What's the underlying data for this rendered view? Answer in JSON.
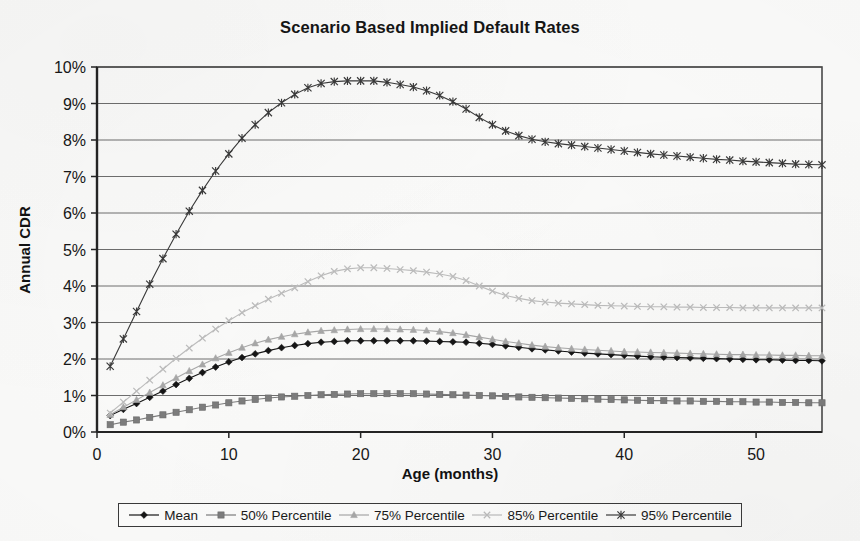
{
  "chart_data": {
    "type": "line",
    "title": "Scenario Based Implied Default Rates",
    "xlabel": "Age (months)",
    "ylabel": "Annual CDR",
    "grid": true,
    "legend_position": "bottom",
    "xlim": [
      0,
      55
    ],
    "ylim": [
      0,
      10
    ],
    "x_ticks": [
      "0",
      "10",
      "20",
      "30",
      "40",
      "50"
    ],
    "x_tick_values": [
      0,
      10,
      20,
      30,
      40,
      50
    ],
    "y_ticks": [
      "0%",
      "1%",
      "2%",
      "3%",
      "4%",
      "5%",
      "6%",
      "7%",
      "8%",
      "9%",
      "10%"
    ],
    "y_tick_values": [
      0,
      1,
      2,
      3,
      4,
      5,
      6,
      7,
      8,
      9,
      10
    ],
    "y_unit": "%",
    "x": [
      1,
      2,
      3,
      4,
      5,
      6,
      7,
      8,
      9,
      10,
      11,
      12,
      13,
      14,
      15,
      16,
      17,
      18,
      19,
      20,
      21,
      22,
      23,
      24,
      25,
      26,
      27,
      28,
      29,
      30,
      31,
      32,
      33,
      34,
      35,
      36,
      37,
      38,
      39,
      40,
      41,
      42,
      43,
      44,
      45,
      46,
      47,
      48,
      49,
      50,
      51,
      52,
      53,
      54,
      55
    ],
    "series": [
      {
        "name": "Mean",
        "color": "#151515",
        "marker": "diamond",
        "values": [
          0.45,
          0.62,
          0.78,
          0.95,
          1.12,
          1.3,
          1.47,
          1.63,
          1.78,
          1.92,
          2.04,
          2.14,
          2.23,
          2.31,
          2.37,
          2.42,
          2.46,
          2.48,
          2.5,
          2.5,
          2.5,
          2.5,
          2.5,
          2.5,
          2.49,
          2.48,
          2.47,
          2.46,
          2.43,
          2.4,
          2.36,
          2.32,
          2.28,
          2.25,
          2.22,
          2.19,
          2.16,
          2.14,
          2.12,
          2.1,
          2.08,
          2.06,
          2.05,
          2.04,
          2.03,
          2.02,
          2.01,
          2.0,
          1.99,
          1.98,
          1.98,
          1.97,
          1.96,
          1.96,
          1.95
        ]
      },
      {
        "name": "50% Percentile",
        "color": "#7d7d7d",
        "marker": "square",
        "values": [
          0.2,
          0.27,
          0.33,
          0.4,
          0.47,
          0.54,
          0.61,
          0.68,
          0.74,
          0.8,
          0.85,
          0.89,
          0.93,
          0.96,
          0.98,
          1.0,
          1.02,
          1.03,
          1.04,
          1.05,
          1.05,
          1.05,
          1.05,
          1.05,
          1.04,
          1.03,
          1.02,
          1.01,
          1.0,
          0.99,
          0.97,
          0.96,
          0.95,
          0.94,
          0.93,
          0.92,
          0.91,
          0.9,
          0.89,
          0.88,
          0.87,
          0.86,
          0.86,
          0.85,
          0.85,
          0.84,
          0.84,
          0.83,
          0.83,
          0.82,
          0.82,
          0.81,
          0.81,
          0.8,
          0.8
        ]
      },
      {
        "name": "75% Percentile",
        "color": "#a8a8a8",
        "marker": "triangle",
        "values": [
          0.47,
          0.68,
          0.88,
          1.08,
          1.28,
          1.48,
          1.67,
          1.85,
          2.02,
          2.17,
          2.31,
          2.43,
          2.53,
          2.61,
          2.68,
          2.73,
          2.77,
          2.79,
          2.81,
          2.82,
          2.82,
          2.82,
          2.81,
          2.8,
          2.78,
          2.75,
          2.71,
          2.66,
          2.6,
          2.54,
          2.48,
          2.43,
          2.38,
          2.34,
          2.31,
          2.28,
          2.26,
          2.24,
          2.22,
          2.2,
          2.19,
          2.18,
          2.17,
          2.16,
          2.15,
          2.14,
          2.13,
          2.12,
          2.12,
          2.11,
          2.11,
          2.1,
          2.1,
          2.09,
          2.09
        ]
      },
      {
        "name": "85% Percentile",
        "color": "#bdbdbd",
        "marker": "cross",
        "values": [
          0.52,
          0.82,
          1.12,
          1.42,
          1.72,
          2.02,
          2.3,
          2.57,
          2.82,
          3.05,
          3.27,
          3.46,
          3.64,
          3.8,
          3.95,
          4.12,
          4.28,
          4.4,
          4.47,
          4.5,
          4.5,
          4.48,
          4.45,
          4.42,
          4.38,
          4.33,
          4.26,
          4.15,
          4.0,
          3.86,
          3.74,
          3.66,
          3.6,
          3.56,
          3.53,
          3.51,
          3.49,
          3.47,
          3.46,
          3.45,
          3.44,
          3.43,
          3.43,
          3.42,
          3.42,
          3.41,
          3.41,
          3.41,
          3.4,
          3.4,
          3.4,
          3.4,
          3.4,
          3.4,
          3.4
        ]
      },
      {
        "name": "95% Percentile",
        "color": "#3a3a3a",
        "marker": "star",
        "values": [
          1.8,
          2.55,
          3.3,
          4.05,
          4.75,
          5.42,
          6.05,
          6.62,
          7.15,
          7.62,
          8.05,
          8.42,
          8.75,
          9.02,
          9.25,
          9.43,
          9.55,
          9.6,
          9.62,
          9.62,
          9.62,
          9.58,
          9.52,
          9.45,
          9.35,
          9.22,
          9.05,
          8.85,
          8.62,
          8.42,
          8.25,
          8.12,
          8.02,
          7.95,
          7.9,
          7.86,
          7.82,
          7.78,
          7.74,
          7.7,
          7.66,
          7.62,
          7.59,
          7.56,
          7.53,
          7.5,
          7.47,
          7.45,
          7.42,
          7.4,
          7.38,
          7.36,
          7.34,
          7.33,
          7.32
        ]
      }
    ]
  },
  "legend": {
    "items": [
      {
        "label": "Mean",
        "marker": "diamond",
        "color": "#151515"
      },
      {
        "label": "50% Percentile",
        "marker": "square",
        "color": "#7d7d7d"
      },
      {
        "label": "75% Percentile",
        "marker": "triangle",
        "color": "#a8a8a8"
      },
      {
        "label": "85% Percentile",
        "marker": "cross",
        "color": "#bdbdbd"
      },
      {
        "label": "95% Percentile",
        "marker": "star",
        "color": "#3a3a3a"
      }
    ]
  },
  "colors": {
    "background": "#fbfbfa",
    "plot_border": "#4a4a4a",
    "gridline": "#6e6e6e",
    "text": "#151515"
  }
}
